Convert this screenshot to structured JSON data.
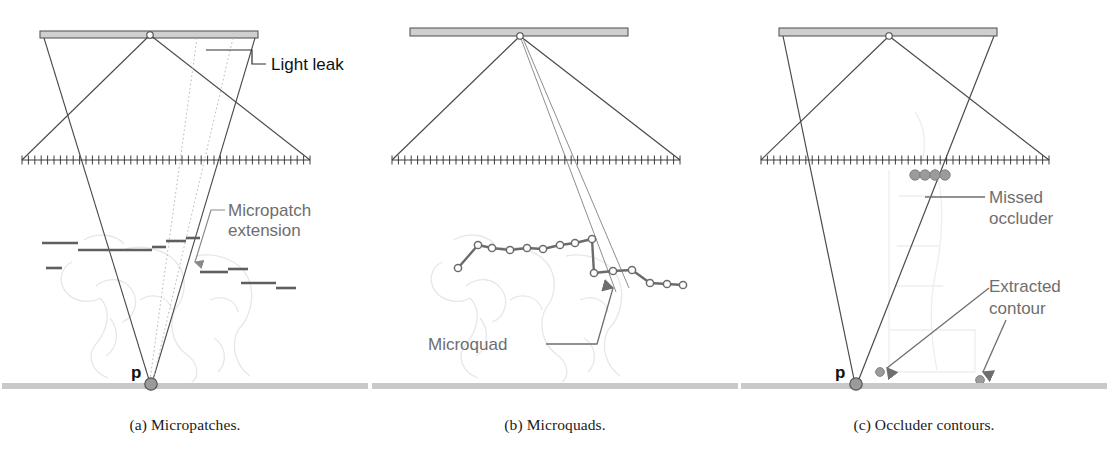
{
  "figure": {
    "background": "#ffffff"
  },
  "colors": {
    "line": "#4a4a4a",
    "line_dark": "#2e2e2e",
    "annotation_text": "#6e6e6e",
    "annotation_leader": "#8a8a8a",
    "caption_text": "#1a1a1a",
    "light_bar_fill": "#cfcfcf",
    "light_bar_stroke": "#5a5a5a",
    "ground_fill": "#c9c9c9",
    "ghost": "#e6e6e6",
    "point_fill": "#9a9a9a",
    "point_stroke": "#555555",
    "patch_stroke": "#5f5f5f",
    "dotted": "#b9b9b9",
    "occluder_dot": "#9b9b9b"
  },
  "panels": [
    {
      "id": "a",
      "caption": "(a) Micropatches.",
      "point_label": "p",
      "annotations": [
        {
          "name": "light-leak",
          "lines": [
            "Light leak"
          ]
        },
        {
          "name": "micropatch-extension",
          "lines": [
            "Micropatch",
            "extension"
          ]
        }
      ],
      "micropatches": [
        {
          "x1": 42,
          "x2": 78,
          "y": 243
        },
        {
          "x1": 78,
          "x2": 113,
          "y": 250
        },
        {
          "x1": 113,
          "x2": 152,
          "y": 250
        },
        {
          "x1": 152,
          "x2": 166,
          "y": 247
        },
        {
          "x1": 166,
          "x2": 186,
          "y": 241
        },
        {
          "x1": 186,
          "x2": 200,
          "y": 238
        },
        {
          "x1": 46,
          "x2": 62,
          "y": 268
        },
        {
          "x1": 200,
          "x2": 228,
          "y": 272
        },
        {
          "x1": 228,
          "x2": 248,
          "y": 269
        },
        {
          "x1": 241,
          "x2": 276,
          "y": 283
        },
        {
          "x1": 276,
          "x2": 296,
          "y": 288
        }
      ]
    },
    {
      "id": "b",
      "caption": "(b) Microquads.",
      "annotations": [
        {
          "name": "microquad",
          "lines": [
            "Microquad"
          ]
        }
      ],
      "contour_vertices": [
        {
          "x": 88,
          "y": 268
        },
        {
          "x": 108,
          "y": 245
        },
        {
          "x": 122,
          "y": 248
        },
        {
          "x": 140,
          "y": 250
        },
        {
          "x": 157,
          "y": 248
        },
        {
          "x": 173,
          "y": 249
        },
        {
          "x": 190,
          "y": 245
        },
        {
          "x": 205,
          "y": 243
        },
        {
          "x": 222,
          "y": 239
        },
        {
          "x": 224,
          "y": 273
        },
        {
          "x": 243,
          "y": 271
        },
        {
          "x": 262,
          "y": 270
        },
        {
          "x": 280,
          "y": 283
        },
        {
          "x": 297,
          "y": 284
        },
        {
          "x": 313,
          "y": 285
        }
      ]
    },
    {
      "id": "c",
      "caption": "(c) Occluder contours.",
      "point_label": "p",
      "annotations": [
        {
          "name": "missed-occluder",
          "lines": [
            "Missed",
            "occluder"
          ]
        },
        {
          "name": "extracted-contour",
          "lines": [
            "Extracted",
            "contour"
          ]
        }
      ],
      "missed_occluder_dots": [
        {
          "x": 176,
          "y": 175
        },
        {
          "x": 186,
          "y": 175
        },
        {
          "x": 196,
          "y": 175
        },
        {
          "x": 206,
          "y": 175
        }
      ],
      "extracted_contour_dots": [
        {
          "x": 141,
          "y": 372
        },
        {
          "x": 241,
          "y": 380
        }
      ]
    }
  ],
  "geometry": {
    "light_bar": {
      "x1": 40,
      "x2": 258,
      "y": 31,
      "height": 7
    },
    "light_source_point": {
      "x": 150,
      "y": 35
    },
    "ruler": {
      "x1": 22,
      "x2": 310,
      "y": 160,
      "ticks": 45,
      "tick_height": 9
    },
    "ground": {
      "x1": 0,
      "x2": 370,
      "y": 383,
      "height": 6
    },
    "receiver_point": {
      "x": 150,
      "y": 383
    }
  }
}
